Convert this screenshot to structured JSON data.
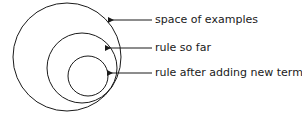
{
  "diagram": {
    "type": "nested-circles-with-labels",
    "labels": [
      {
        "text": "space of examples"
      },
      {
        "text": "rule so far"
      },
      {
        "text": "rule after adding new term"
      }
    ],
    "stroke_color": "#1a1a1a"
  }
}
